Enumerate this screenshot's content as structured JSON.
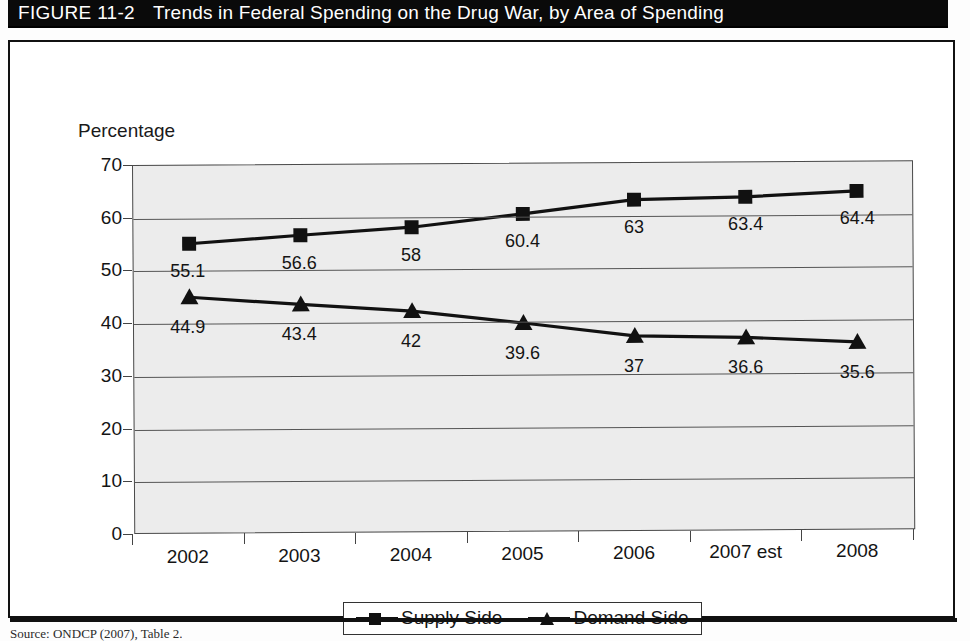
{
  "figure": {
    "label": "FIGURE 11-2",
    "title": "Trends in Federal Spending on the Drug War, by Area of Spending"
  },
  "source_note": "Source: ONDCP (2007), Table 2.",
  "colors": {
    "band_background": "#0a0a0a",
    "band_text": "#ffffff",
    "plot_background": "#ececec",
    "series_ink": "#111111",
    "gridline": "#555555",
    "frame": "#111111"
  },
  "legend": {
    "position": "bottom-center",
    "entries": [
      {
        "label": "Supply Side",
        "marker": "square"
      },
      {
        "label": "Demand Side",
        "marker": "triangle"
      }
    ]
  },
  "chart_data": {
    "type": "line",
    "title": "Trends in Federal Spending on the Drug War, by Area of Spending",
    "xlabel": "",
    "ylabel": "Percentage",
    "categories": [
      "2002",
      "2003",
      "2004",
      "2005",
      "2006",
      "2007 est",
      "2008"
    ],
    "yticks": [
      0,
      10,
      20,
      30,
      40,
      50,
      60,
      70
    ],
    "ylim": [
      0,
      70
    ],
    "grid": true,
    "data_labels": true,
    "series": [
      {
        "name": "Supply Side",
        "marker": "square",
        "values": [
          55.1,
          56.6,
          58,
          60.4,
          63,
          63.4,
          64.4
        ],
        "labels": [
          "55.1",
          "56.6",
          "58",
          "60.4",
          "63",
          "63.4",
          "64.4"
        ]
      },
      {
        "name": "Demand Side",
        "marker": "triangle",
        "values": [
          44.9,
          43.4,
          42,
          39.6,
          37,
          36.6,
          35.6
        ],
        "labels": [
          "44.9",
          "43.4",
          "42",
          "39.6",
          "37",
          "36.6",
          "35.6"
        ]
      }
    ]
  }
}
